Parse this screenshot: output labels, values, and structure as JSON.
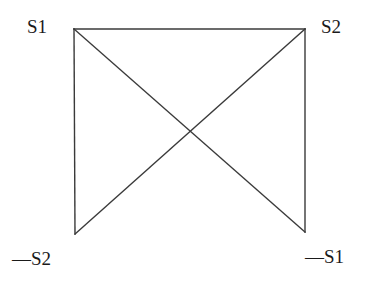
{
  "diagram": {
    "type": "crossed-square (semiotic square style)",
    "stroke_color": "#3a3a3a",
    "text_color": "#1a1a1a",
    "background": "#ffffff",
    "labels": {
      "top_left": "S1",
      "top_right": "S2",
      "bottom_left": "—S2",
      "bottom_right": "—S1"
    },
    "nodes": [
      {
        "id": "top_left",
        "label": "S1",
        "x": 74,
        "y": 29
      },
      {
        "id": "top_right",
        "label": "S2",
        "x": 305,
        "y": 29
      },
      {
        "id": "bottom_left",
        "label": "—S2",
        "x": 75,
        "y": 234
      },
      {
        "id": "bottom_right",
        "label": "—S1",
        "x": 305,
        "y": 232
      }
    ],
    "edges": [
      {
        "from": "top_left",
        "to": "top_right",
        "kind": "horizontal"
      },
      {
        "from": "top_left",
        "to": "bottom_left",
        "kind": "vertical"
      },
      {
        "from": "top_right",
        "to": "bottom_right",
        "kind": "vertical"
      },
      {
        "from": "top_left",
        "to": "bottom_right",
        "kind": "diagonal"
      },
      {
        "from": "top_right",
        "to": "bottom_left",
        "kind": "diagonal"
      }
    ]
  }
}
